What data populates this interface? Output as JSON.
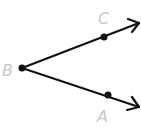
{
  "diagram": {
    "type": "angle",
    "vertex": {
      "label": "B",
      "x": 22,
      "y": 68
    },
    "rays": [
      {
        "name": "BC",
        "point": {
          "label": "C",
          "x": 104,
          "y": 37
        },
        "tip": {
          "x": 139,
          "y": 23
        }
      },
      {
        "name": "BA",
        "point": {
          "label": "A",
          "x": 108,
          "y": 95
        },
        "tip": {
          "x": 139,
          "y": 107
        }
      }
    ],
    "colors": {
      "line": "#111111",
      "label": "#c8c8c8"
    }
  }
}
